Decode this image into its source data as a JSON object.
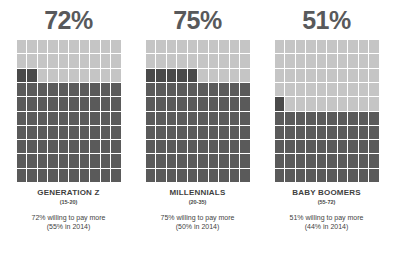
{
  "chart_data": {
    "type": "bar",
    "subtype": "waffle-grid",
    "xlabel": "",
    "ylabel": "",
    "grid": {
      "columns": 10,
      "rows": 10,
      "unit_value": 1,
      "total": 100
    },
    "categories": [
      "GENERATION Z",
      "MILLENNIALS",
      "BABY BOOMERS"
    ],
    "values": [
      72,
      75,
      51
    ],
    "series": [
      {
        "name": "2016 willing to pay more",
        "values": [
          72,
          75,
          51
        ]
      },
      {
        "name": "2014 willing to pay more",
        "values": [
          55,
          50,
          44
        ]
      }
    ],
    "colors": {
      "filled": "#5a5a5a",
      "empty": "#c5c5c5",
      "accent": "#4a4a4a",
      "gridline": "#ffffff",
      "heading_text": "#58595b",
      "label_text": "#3f3f3f",
      "background": "#ffffff"
    },
    "legend_position": "none",
    "grid_lines": true
  },
  "panels": [
    {
      "percent_label": "72%",
      "value": 72,
      "group_name": "GENERATION Z",
      "age_range": "(15-20)",
      "stat_main": "72% willing to pay more",
      "stat_prior": "(55% in 2014)"
    },
    {
      "percent_label": "75%",
      "value": 75,
      "group_name": "MILLENNIALS",
      "age_range": "(20-35)",
      "stat_main": "75% willing to pay more",
      "stat_prior": "(50% in 2014)"
    },
    {
      "percent_label": "51%",
      "value": 51,
      "group_name": "BABY BOOMERS",
      "age_range": "(55-72)",
      "stat_main": "51% willing to pay more",
      "stat_prior": "(44% in 2014)"
    }
  ]
}
